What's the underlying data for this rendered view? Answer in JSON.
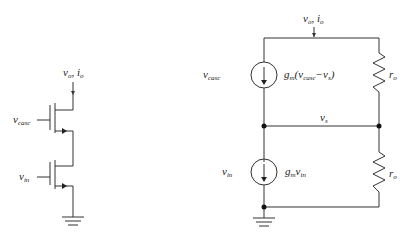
{
  "figure": {
    "left_circuit": {
      "title": "cascode transistor stack",
      "output_label": {
        "v": "v",
        "v_sub": "o",
        "sep": ", ",
        "i": "i",
        "i_sub": "o"
      },
      "upper_gate_label": {
        "main": "v",
        "sub": "casc"
      },
      "lower_gate_label": {
        "main": "v",
        "sub": "in"
      }
    },
    "right_circuit": {
      "title": "small-signal model",
      "output_label": {
        "v": "v",
        "v_sub": "o",
        "sep": ", ",
        "i": "i",
        "i_sub": "o"
      },
      "upper_source_ctrl": {
        "main": "v",
        "sub": "casc"
      },
      "upper_source_expr": {
        "g": "g",
        "g_sub": "m",
        "open": "(",
        "v1": "v",
        "v1_sub": "casc",
        "minus": "−",
        "v2": "v",
        "v2_sub": "s",
        "close": ")"
      },
      "upper_resistor": {
        "main": "r",
        "sub": "o"
      },
      "mid_node": {
        "main": "v",
        "sub": "s"
      },
      "lower_source_ctrl": {
        "main": "v",
        "sub": "in"
      },
      "lower_source_expr": {
        "g": "g",
        "g_sub": "m",
        "v": "v",
        "v_sub": "in"
      },
      "lower_resistor": {
        "main": "r",
        "sub": "o"
      }
    }
  }
}
